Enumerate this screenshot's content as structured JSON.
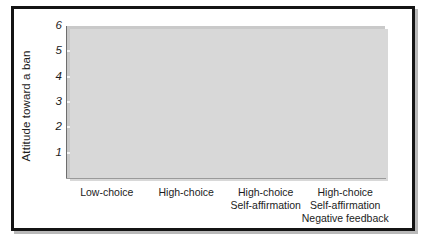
{
  "figure": {
    "frame_color": "#141414",
    "panel_color": "#c9c9c9",
    "gridline_color": "#f4f4f4",
    "bar_color": "#6f6f6f",
    "bar_color_highlight": "#232323",
    "bar_shadow_color": "#b0b0b0"
  },
  "chart_data": {
    "type": "bar",
    "title": "",
    "xlabel": "",
    "ylabel": "Attitude toward a ban",
    "ylim": [
      0,
      6
    ],
    "yticks": [
      1,
      2,
      3,
      4,
      5,
      6
    ],
    "ytick_labels": [
      "1",
      "2",
      "3",
      "4",
      "5",
      "6"
    ],
    "grid": true,
    "legend": null,
    "categories": [
      "Low-choice",
      "High-choice",
      "High-choice\nSelf-affirmation",
      "High-choice\nSelf-affirmation\nNegative feedback"
    ],
    "category_lines": [
      [
        "Low-choice"
      ],
      [
        "High-choice"
      ],
      [
        "High-choice",
        "Self-affirmation"
      ],
      [
        "High-choice",
        "Self-affirmation",
        "Negative feedback"
      ]
    ],
    "values": [
      2.8,
      4.0,
      2.1,
      4.85
    ],
    "bar_colors": [
      "#6f6f6f",
      "#6f6f6f",
      "#232323",
      "#6f6f6f"
    ]
  }
}
